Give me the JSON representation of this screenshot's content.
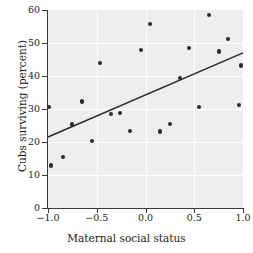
{
  "chart_data": {
    "type": "scatter",
    "title": "",
    "xlabel": "Maternal social status",
    "ylabel": "Cubs surviving (percent)",
    "xlim": [
      -1.0,
      1.0
    ],
    "ylim": [
      0,
      60
    ],
    "xticks": [
      -1.0,
      -0.5,
      0.0,
      0.5,
      1.0
    ],
    "xticklabels": [
      "−1.0",
      "−0.5",
      "0.0",
      "0.5",
      "1.0"
    ],
    "yticks": [
      0,
      10,
      20,
      30,
      40,
      50,
      60
    ],
    "yticklabels": [
      "0",
      "10",
      "20",
      "30",
      "40",
      "50",
      "60"
    ],
    "grid": true,
    "legend": false,
    "plot_background_color": "#eeeeee",
    "gridline_color": "#ffffff",
    "point_color": "#2b2b2b",
    "line_color": "#2b2b2b",
    "points": [
      {
        "x": -0.99,
        "y": 30.6
      },
      {
        "x": -0.97,
        "y": 12.9
      },
      {
        "x": -0.85,
        "y": 15.4
      },
      {
        "x": -0.75,
        "y": 25.3
      },
      {
        "x": -0.65,
        "y": 32.3
      },
      {
        "x": -0.55,
        "y": 20.2
      },
      {
        "x": -0.47,
        "y": 44.0
      },
      {
        "x": -0.35,
        "y": 28.4
      },
      {
        "x": -0.26,
        "y": 28.7
      },
      {
        "x": -0.16,
        "y": 23.4
      },
      {
        "x": -0.05,
        "y": 48.0
      },
      {
        "x": 0.05,
        "y": 55.8
      },
      {
        "x": 0.15,
        "y": 23.2
      },
      {
        "x": 0.25,
        "y": 25.4
      },
      {
        "x": 0.35,
        "y": 39.4
      },
      {
        "x": 0.45,
        "y": 48.4
      },
      {
        "x": 0.55,
        "y": 30.6
      },
      {
        "x": 0.65,
        "y": 58.6
      },
      {
        "x": 0.75,
        "y": 47.4
      },
      {
        "x": 0.85,
        "y": 51.3
      },
      {
        "x": 0.96,
        "y": 31.2
      },
      {
        "x": 0.98,
        "y": 43.2
      }
    ],
    "trendline": {
      "name": "regression-line",
      "x_start": -1.0,
      "y_start": 21.5,
      "x_end": 1.0,
      "y_end": 47.0
    }
  }
}
